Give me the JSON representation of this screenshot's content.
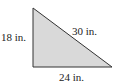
{
  "diagram": {
    "type": "right-triangle",
    "fill_color": "#d9d9d9",
    "stroke_color": "#333333",
    "vertices": {
      "top": [
        33,
        8
      ],
      "right_angle": [
        33,
        67
      ],
      "right": [
        112,
        67
      ]
    },
    "labels": {
      "left_side": "18 in.",
      "hypotenuse": "30 in.",
      "bottom_side": "24 in."
    }
  }
}
